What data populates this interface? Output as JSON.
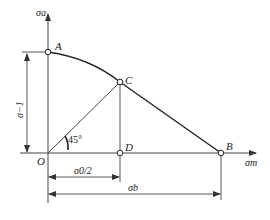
{
  "diagram": {
    "axes": {
      "y_label": "σa",
      "x_label": "σm",
      "origin_label": "O"
    },
    "points": {
      "A": "A",
      "B": "B",
      "C": "C",
      "D": "D"
    },
    "angle_label": "45°",
    "dimensions": {
      "sigma_minus1": "σ−1",
      "sigma0_half": "σ0/2",
      "sigma_b": "σb"
    },
    "colors": {
      "line": "#333333",
      "curve": "#222222",
      "background": "#ffffff"
    }
  }
}
